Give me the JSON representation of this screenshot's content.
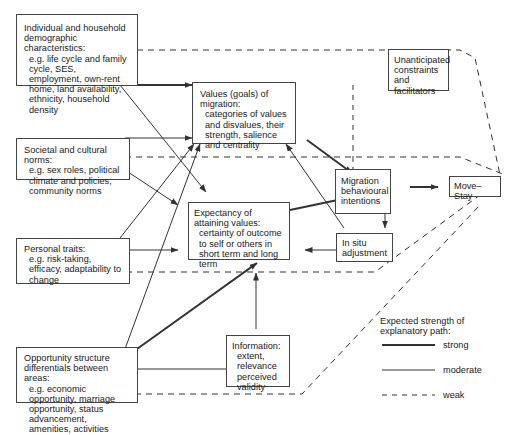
{
  "boxes": {
    "individual": {
      "title": "Individual and household demographic characteristics:",
      "body": "e.g. life cycle and family cycle, SES, employment, own-rent home, land availability, ethnicity, household density"
    },
    "societal": {
      "title": "Societal and cultural norms:",
      "body": "e.g. sex roles, political climate and policies, community norms"
    },
    "personal": {
      "title": "Personal traits:",
      "body": "e.g. risk-taking, efficacy, adaptability to change"
    },
    "opportunity": {
      "title": "Opportunity structure differentials between areas:",
      "body": "e.g. economic opportunity, marriage opportunity, status advancement, amenities, activities"
    },
    "values": {
      "title": "Values (goals) of migration:",
      "body": "categories of values and disvalues, their strength, salience and centrality"
    },
    "expectancy": {
      "title": "Expectancy of attaining values:",
      "body": "certainty of outcome to self or others in short term and long term"
    },
    "information": {
      "title": "Information:",
      "body": "extent, relevance perceived validity"
    },
    "intentions": {
      "title": "Migration behavioural intentions",
      "body": ""
    },
    "insitu": {
      "title": "In situ adjustment",
      "body": ""
    },
    "unanticipated": {
      "title": "Unanticipated constraints and facilitators",
      "body": ""
    },
    "movestay": {
      "title": "Move–Stay",
      "body": ""
    }
  },
  "legend": {
    "title": "Expected strength of explanatory path:",
    "items": [
      {
        "label": "strong",
        "style": "solid-thick"
      },
      {
        "label": "moderate",
        "style": "solid-thin"
      },
      {
        "label": "weak",
        "style": "dashed"
      }
    ]
  },
  "colors": {
    "line": "#333333",
    "border": "#444444",
    "background": "#ffffff"
  }
}
